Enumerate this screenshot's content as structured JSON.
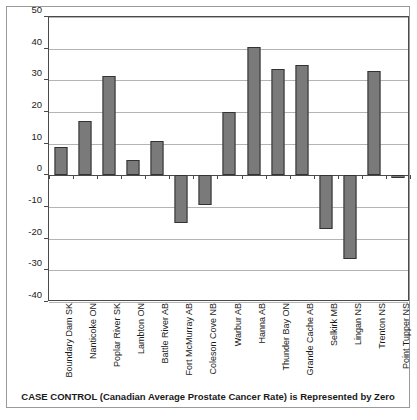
{
  "chart_data": {
    "type": "bar",
    "title": "",
    "subtitle": "",
    "xlabel": "CASE CONTROL (Canadian Average Prostate Cancer Rate) is Represented by Zero",
    "ylabel": "People/100,000 Varrying from CASE CONTROL (0)",
    "ylim": [
      -40,
      50
    ],
    "ytick_step": 10,
    "yticks": [
      "50",
      "40",
      "30",
      "20",
      "10",
      "0",
      "-10",
      "-20",
      "-30",
      "-40"
    ],
    "ytick_values": [
      50,
      40,
      30,
      20,
      10,
      0,
      -10,
      -20,
      -30,
      -40
    ],
    "grid": true,
    "legend": false,
    "legend_position": "none",
    "bar_color": "#7a7a7a",
    "bar_edge_color": "#333333",
    "categories": [
      "Boundary Dam SK",
      "Nanticoke ON",
      "Poplar River SK",
      "Lambton ON",
      "Battle River AB",
      "Fort McMurray AB",
      "Coleson Cove NB",
      "Warbur AB",
      "Hanna AB",
      "Thunder Bay ON",
      "Grande Cache AB",
      "Selkirk MB",
      "Lingan NS",
      "Trenton NS",
      "Point Tupper NS"
    ],
    "values": [
      9,
      17.3,
      31.5,
      5,
      11,
      -15,
      -9.5,
      20,
      40.5,
      33.5,
      35,
      -17,
      -26.5,
      33,
      -1
    ]
  },
  "caption": {
    "text": "CASE CONTROL (Canadian Average Prostate Cancer Rate) is Represented by Zero"
  },
  "axes": {
    "y_title": "People/100,000 Varrying from CASE CONTROL (0)"
  }
}
